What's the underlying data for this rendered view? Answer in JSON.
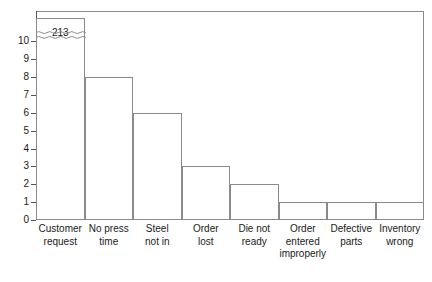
{
  "chart_data": {
    "type": "bar",
    "title": "",
    "subtitle": "",
    "xlabel": "",
    "ylabel": "",
    "categories": [
      "Customer\nrequest",
      "No press\ntime",
      "Steel\nnot in",
      "Order\nlost",
      "Die not\nready",
      "Order\nentered\nimproperly",
      "Defective\nparts",
      "Inventory\nwrong"
    ],
    "values": [
      213,
      8,
      6,
      3,
      2,
      1,
      1,
      1
    ],
    "displayed_heights": [
      11.3,
      8,
      6,
      3,
      2,
      1,
      1,
      1
    ],
    "data_labels": [
      "213",
      "",
      "",
      "",
      "",
      "",
      "",
      ""
    ],
    "ylim": [
      0,
      11.7
    ],
    "ytick_labels": [
      "0",
      "1",
      "2",
      "3",
      "4",
      "5",
      "6",
      "7",
      "8",
      "9",
      "10"
    ],
    "ytick_values": [
      0,
      1,
      2,
      3,
      4,
      5,
      6,
      7,
      8,
      9,
      10
    ],
    "axis_break": {
      "present": true,
      "style": "wavy",
      "at_value": 10.35,
      "note": "First bar truncated; actual value 213"
    },
    "grid": false,
    "legend": null,
    "legend_position": "none",
    "bar_gap": 0,
    "colors": {
      "bar_fill": "#ffffff",
      "bar_stroke": "#8a8a8a",
      "axis": "#555555",
      "frame": "#8a8a8a",
      "text": "#1a1a1a",
      "background": "#ffffff"
    }
  }
}
